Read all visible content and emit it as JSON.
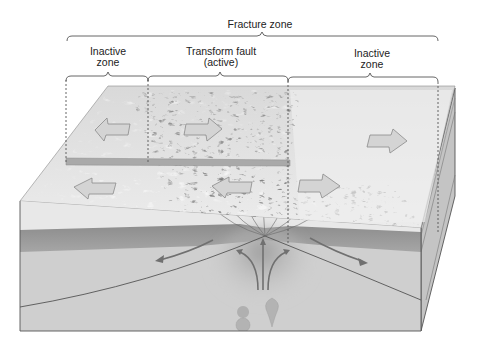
{
  "diagram": {
    "title_label": "Fracture zone",
    "zones": [
      {
        "line1": "Inactive",
        "line2": "zone"
      },
      {
        "line1": "Transform fault",
        "line2": "(active)"
      },
      {
        "line1": "Inactive",
        "line2": "zone"
      }
    ],
    "plate_motion_arrows": [
      {
        "position": "back-left",
        "direction": "left"
      },
      {
        "position": "back-center",
        "direction": "right"
      },
      {
        "position": "back-right",
        "direction": "right"
      },
      {
        "position": "front-left",
        "direction": "left"
      },
      {
        "position": "front-center",
        "direction": "left"
      },
      {
        "position": "front-right",
        "direction": "right"
      }
    ],
    "mantle_flow_arrows": [
      "left-diverging",
      "right-diverging",
      "upwelling-center",
      "upwelling-left",
      "upwelling-right"
    ],
    "colors": {
      "seafloor": "#e6e6e6",
      "crust": "#9a9a9a",
      "mantle": "#cfcfcf",
      "side_face": "#bdbdbd",
      "text": "#222222"
    }
  }
}
